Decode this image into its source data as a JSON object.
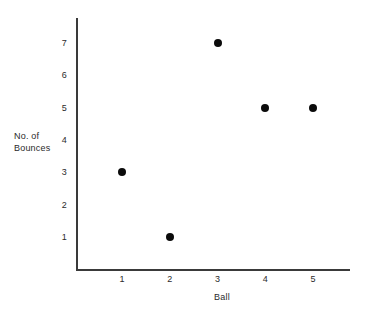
{
  "chart_data": {
    "type": "scatter",
    "title": "",
    "xlabel": "Ball",
    "ylabel": "No. of\nBounces",
    "x": [
      1,
      2,
      3,
      4,
      5
    ],
    "values": [
      3,
      1,
      7,
      5,
      5
    ],
    "points": [
      {
        "x": 1,
        "y": 3
      },
      {
        "x": 2,
        "y": 1
      },
      {
        "x": 3,
        "y": 7
      },
      {
        "x": 4,
        "y": 5
      },
      {
        "x": 5,
        "y": 5
      }
    ],
    "xticks": [
      "1",
      "2",
      "3",
      "4",
      "5"
    ],
    "yticks": [
      "1",
      "2",
      "3",
      "4",
      "5",
      "6",
      "7"
    ],
    "xlim": [
      0.5,
      5.7
    ],
    "ylim": [
      0,
      7.8
    ],
    "grid": false,
    "legend": null,
    "marker_color": "#0b0b0b",
    "axis_color": "#3a3a3a",
    "text_color": "#2b2b2b",
    "background_color": "#ffffff"
  },
  "geometry": {
    "x_origin_px": 76,
    "y_baseline_px": 269,
    "x_unit_px": 47.8,
    "y_unit_px": 32.33,
    "x_tick1_px": 122,
    "y_tick1_px": 237
  }
}
